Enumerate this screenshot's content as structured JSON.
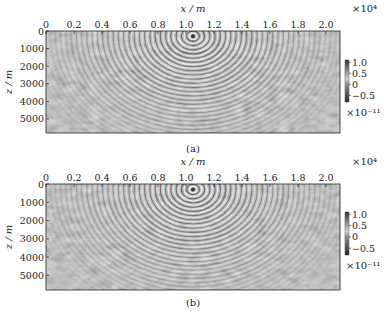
{
  "chart_data": [
    {
      "type": "heatmap",
      "caption": "(a)",
      "xlabel": "x / m",
      "ylabel": "z / m",
      "x_multiplier": "×10⁴",
      "xlim": [
        0,
        2.1
      ],
      "ylim": [
        5800,
        0
      ],
      "x_ticks": [
        "0",
        "0.2",
        "0.4",
        "0.6",
        "0.8",
        "1.0",
        "1.2",
        "1.4",
        "1.6",
        "1.8",
        "2.0"
      ],
      "x_tick_values": [
        0,
        0.2,
        0.4,
        0.6,
        0.8,
        1.0,
        1.2,
        1.4,
        1.6,
        1.8,
        2.0
      ],
      "y_ticks": [
        "0",
        "1000",
        "2000",
        "3000",
        "4000",
        "5000"
      ],
      "y_tick_values": [
        0,
        1000,
        2000,
        3000,
        4000,
        5000
      ],
      "colorbar": {
        "ticks": [
          "1.0",
          "0.5",
          "0",
          "−0.5"
        ],
        "tick_values": [
          1.0,
          0.5,
          0,
          -0.5
        ],
        "range": [
          -0.8,
          1.1
        ],
        "multiplier": "×10⁻¹¹",
        "colormap": "gray"
      },
      "features": {
        "source_x": 1.05,
        "source_z": 300,
        "description": "Wavefield snapshot with concentric wavefronts emanating from a source near x≈1.05×10⁴ m, z≈300 m; scattered noise-like patterns elsewhere"
      }
    },
    {
      "type": "heatmap",
      "caption": "(b)",
      "xlabel": "x / m",
      "ylabel": "z / m",
      "x_multiplier": "×10⁴",
      "xlim": [
        0,
        2.1
      ],
      "ylim": [
        5800,
        0
      ],
      "x_ticks": [
        "0",
        "0.2",
        "0.4",
        "0.6",
        "0.8",
        "1.0",
        "1.2",
        "1.4",
        "1.6",
        "1.8",
        "2.0"
      ],
      "x_tick_values": [
        0,
        0.2,
        0.4,
        0.6,
        0.8,
        1.0,
        1.2,
        1.4,
        1.6,
        1.8,
        2.0
      ],
      "y_ticks": [
        "0",
        "1000",
        "2000",
        "3000",
        "4000",
        "5000"
      ],
      "y_tick_values": [
        0,
        1000,
        2000,
        3000,
        4000,
        5000
      ],
      "colorbar": {
        "ticks": [
          "1.0",
          "0.5",
          "0",
          "−0.5"
        ],
        "tick_values": [
          1.0,
          0.5,
          0,
          -0.5
        ],
        "range": [
          -0.8,
          1.1
        ],
        "multiplier": "×10⁻¹¹",
        "colormap": "gray"
      },
      "features": {
        "source_x": 1.05,
        "source_z": 300,
        "description": "Wavefield snapshot with concentric wavefronts emanating from a source near x≈1.05×10⁴ m, z≈300 m; scattered noise-like patterns elsewhere"
      }
    }
  ]
}
